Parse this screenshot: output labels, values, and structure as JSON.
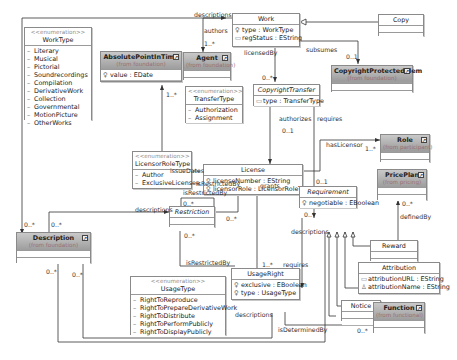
{
  "diagram": {
    "classes": {
      "work": {
        "name": "Work",
        "attrs": [
          "type : WorkType",
          "regStatus : EString"
        ]
      },
      "copy": {
        "name": "Copy"
      },
      "agent": {
        "name": "Agent",
        "from": "(from foundation)"
      },
      "absolute_point": {
        "name": "AbsolutePointInTime",
        "from": "(from foundation)",
        "attrs": [
          "value : EDate"
        ]
      },
      "copyright_protected": {
        "name": "CopyrightProtectedElem",
        "from": "(from foundation)"
      },
      "copyright_transfer": {
        "name": "CopyrightTransfer",
        "attrs": [
          "type : TransferType"
        ]
      },
      "license": {
        "name": "License",
        "attrs": [
          "licenseNumber : EString",
          "licensorRole : LicensorRoleType"
        ]
      },
      "role": {
        "name": "Role",
        "from": "(from participant)"
      },
      "price_plan": {
        "name": "PricePlan",
        "from": "(from pricing)"
      },
      "requirement": {
        "name": "Requirement",
        "attrs": [
          "negotiable : EBoolean"
        ]
      },
      "reward": {
        "name": "Reward"
      },
      "attribution": {
        "name": "Attribution",
        "attrs": [
          "attributionURL : EString",
          "attributionName : EString"
        ]
      },
      "notice": {
        "name": "Notice"
      },
      "function": {
        "name": "Function",
        "from": "(from functional)"
      },
      "restriction": {
        "name": "Restriction"
      },
      "description": {
        "name": "Description",
        "from": "(from foundation)"
      },
      "usage_right": {
        "name": "UsageRight",
        "attrs": [
          "exclusive : EBoolean",
          "type : UsageType"
        ]
      }
    },
    "enumerations": {
      "stereotype": "<<enumeration>>",
      "work_type": {
        "name": "WorkType",
        "literals": [
          "Literary",
          "Musical",
          "Pictorial",
          "Soundrecordings",
          "Compilation",
          "DerivativeWork",
          "Collection",
          "Governmental",
          "MotionPicture",
          "OtherWorks"
        ]
      },
      "transfer_type": {
        "name": "TransferType",
        "literals": [
          "Authorization",
          "Assignment"
        ]
      },
      "licensor_role_type": {
        "name": "LicensorRoleType",
        "literals": [
          "Author",
          "ExclusiveLicensee"
        ]
      },
      "usage_type": {
        "name": "UsageType",
        "literals": [
          "RightToReproduce",
          "RightToPrepareDerivativeWork",
          "RightToDistribute",
          "RightToPerformPublicly",
          "RightToDisplayPublicly"
        ]
      }
    },
    "labels": {
      "descriptions_top": "descriptions",
      "authors": "authors",
      "authors_mult": "1..*",
      "licensed_by": "licensedBy",
      "licensed_by_mult": "0..*",
      "subsumes": "subsumes",
      "subsumes_mult": "0..1",
      "issue_dates": "issueDates",
      "issue_dates_mult": "1..*",
      "authorizes": "authorizes",
      "authorizes_mult": "0..1",
      "requires_top": "requires",
      "has_licensor": "hasLicensor",
      "has_licensor_mult": "1..*",
      "requires_mult": "0..1",
      "is_restricted_by_lic": "isRestrictedBy",
      "grants": "grants",
      "is_restricted_by_self": "isRestrictedBy",
      "self_mult": "0..*",
      "descriptions_restr": "descriptions",
      "restr_lic_mult": "0..*",
      "restr_ur_mult": "0..*",
      "is_restricted_by_ur": "isRestrictedBy",
      "defined_by": "definedBy",
      "defined_by_mult": "0..*",
      "req_desc_mult": "0..*",
      "descriptions_req": "descriptions",
      "requires_ur": "requires",
      "grants_mult": "1..*",
      "desc_mult_a": "0..*",
      "desc_mult_b": "0..*",
      "desc_mult_c": "0..*",
      "desc_mult_d": "0..*",
      "descriptions_ur": "descriptions",
      "is_determined_by": "isDeterminedBy",
      "function_mult": "0..*"
    }
  }
}
